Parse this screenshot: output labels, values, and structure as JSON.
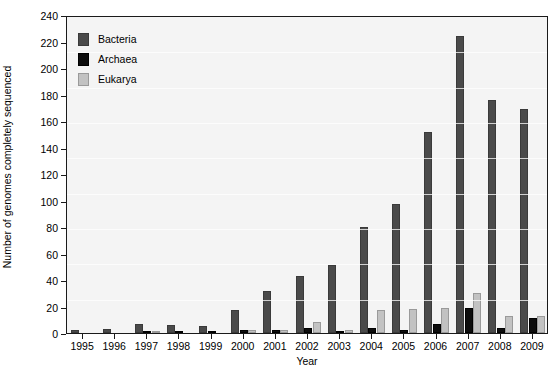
{
  "chart_data": {
    "type": "bar",
    "title": "",
    "xlabel": "Year",
    "ylabel": "Number of genomes completely sequenced",
    "categories": [
      "1995",
      "1996",
      "1997",
      "1998",
      "1999",
      "2000",
      "2001",
      "2002",
      "2003",
      "2004",
      "2005",
      "2006",
      "2007",
      "2008",
      "2009"
    ],
    "ylim": [
      0,
      240
    ],
    "yticks": [
      0,
      20,
      40,
      60,
      80,
      100,
      120,
      140,
      160,
      180,
      200,
      220,
      240
    ],
    "grid": false,
    "legend_position": "top-left",
    "series": [
      {
        "name": "Bacteria",
        "color": "#4a4a4a",
        "values": [
          2,
          3,
          7,
          6,
          5,
          17,
          32,
          43,
          51,
          80,
          97,
          152,
          224,
          176,
          169
        ]
      },
      {
        "name": "Archaea",
        "color": "#0d0d0d",
        "values": [
          0,
          0,
          1,
          1,
          1,
          2,
          2,
          4,
          1,
          4,
          2,
          7,
          19,
          4,
          11
        ]
      },
      {
        "name": "Eukarya",
        "color": "#c2c2c2",
        "values": [
          0,
          0,
          1,
          0,
          0,
          2,
          2,
          8,
          2,
          17,
          18,
          19,
          30,
          13,
          13
        ]
      }
    ]
  },
  "legend": {
    "items": [
      {
        "label": "Bacteria",
        "swatch": "bacteria-swatch"
      },
      {
        "label": "Archaea",
        "swatch": "archaea-swatch"
      },
      {
        "label": "Eukarya",
        "swatch": "eukarya-swatch"
      }
    ]
  },
  "colors": {
    "bacteria": "#4a4a4a",
    "archaea": "#0d0d0d",
    "eukarya": "#c2c2c2",
    "plot_background": "#f4f4f4",
    "axis": "#1a1a1a",
    "page_background": "#ffffff"
  }
}
